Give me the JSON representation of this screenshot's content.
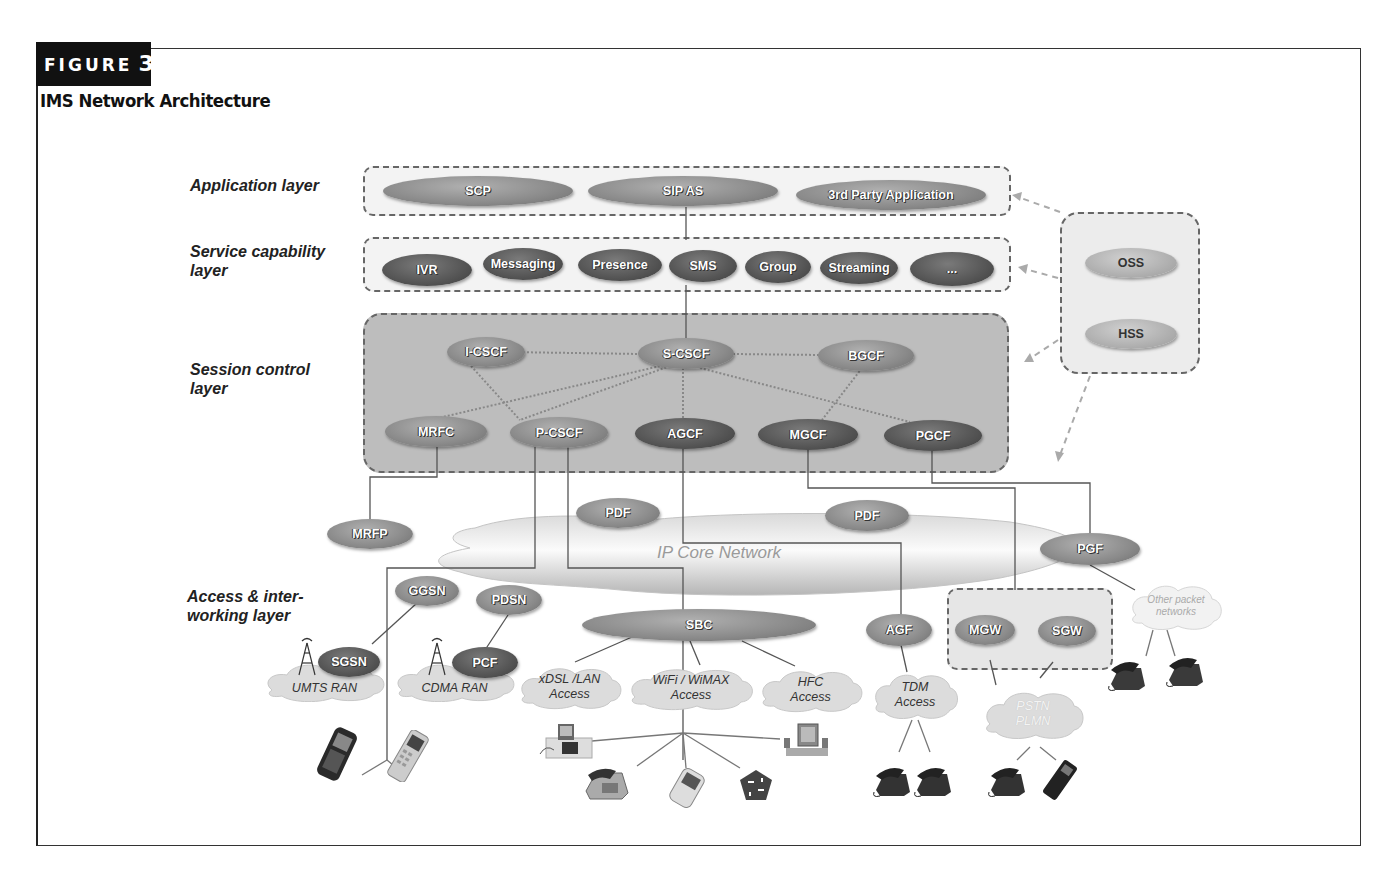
{
  "figure": {
    "tag": "FIGURE",
    "number": "3",
    "title": "IMS Network Architecture"
  },
  "layers": {
    "application": "Application layer",
    "service_capability_1": "Service capability",
    "service_capability_2": "layer",
    "session_control_1": "Session control",
    "session_control_2": "layer",
    "access_1": "Access & inter-",
    "access_2": "working layer"
  },
  "application_layer": {
    "nodes": [
      "SCP",
      "SIP AS",
      "3rd Party Application"
    ]
  },
  "service_capability_layer": {
    "nodes": [
      "IVR",
      "Messaging",
      "Presence",
      "SMS",
      "Group",
      "Streaming",
      "..."
    ]
  },
  "session_control_layer": {
    "top_nodes": [
      "I-CSCF",
      "S-CSCF",
      "BGCF"
    ],
    "bottom_nodes": [
      "MRFC",
      "P-CSCF",
      "AGCF",
      "MGCF",
      "PGCF"
    ]
  },
  "management": {
    "nodes": [
      "OSS",
      "HSS"
    ]
  },
  "core": {
    "network_label": "IP Core Network",
    "nodes": [
      "MRFP",
      "PDF",
      "PDF",
      "PGF"
    ]
  },
  "access_layer": {
    "gateways": [
      "GGSN",
      "PDSN",
      "SBC",
      "AGF",
      "MGW",
      "SGW"
    ],
    "ran_nodes": [
      "SGSN",
      "PCF"
    ],
    "clouds": {
      "umts": "UMTS RAN",
      "cdma": "CDMA RAN",
      "xdsl_1": "xDSL /LAN",
      "xdsl_2": "Access",
      "wifi_1": "WiFi / WiMAX",
      "wifi_2": "Access",
      "hfc_1": "HFC",
      "hfc_2": "Access",
      "tdm_1": "TDM",
      "tdm_2": "Access",
      "pstn_1": "PSTN",
      "pstn_2": "PLMN",
      "other_1": "Other packet",
      "other_2": "networks"
    }
  },
  "devices": [
    "pda-phone",
    "mobile-phone",
    "videophone",
    "desk-phone",
    "pda",
    "router",
    "desktop-pc",
    "tdm-phone",
    "tdm-phone",
    "pstn-phone",
    "pstn-mobile",
    "packet-phone",
    "packet-phone"
  ],
  "colors": {
    "frame": "#333333",
    "node_mid": "#8a8a8a",
    "node_dark": "#555555",
    "node_light": "#b0b0b0",
    "session_box_fill": "#bdbdbd",
    "layer_box_fill": "#f0f0f0"
  }
}
